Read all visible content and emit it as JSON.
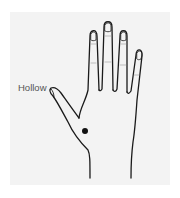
{
  "figure": {
    "annotation": {
      "label": "Hollow",
      "target": "space between thumb and index finger"
    },
    "marker": {
      "shape": "dot",
      "color": "#111111"
    }
  },
  "colors": {
    "background": "#ffffff",
    "panel": "#f3f3f3",
    "outline": "#1a1a1a",
    "label_text": "#555555"
  }
}
